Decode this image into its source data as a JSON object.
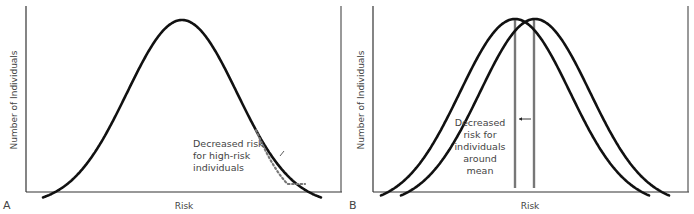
{
  "panels": [
    {
      "id": "A",
      "panel_letter": "A",
      "xlabel": "Risk",
      "ylabel": "Number of Individuals",
      "annotation": [
        "Decreased risk",
        "for high-risk",
        "individuals"
      ],
      "curves": [
        {
          "name": "population distribution",
          "style": "solid",
          "mean": 0.0,
          "sd": 1.0,
          "x_range": [
            -2.6,
            2.6
          ]
        },
        {
          "name": "shifted high-risk tail",
          "style": "dotted",
          "description": "upper tail shifted toward lower risk"
        }
      ]
    },
    {
      "id": "B",
      "panel_letter": "B",
      "xlabel": "Risk",
      "ylabel": "Number of Individuals",
      "annotation": [
        "Decreased",
        "risk for",
        "individuals",
        "around",
        "mean"
      ],
      "curves": [
        {
          "name": "shifted distribution",
          "style": "solid",
          "mean": -0.12,
          "sd": 1.0
        },
        {
          "name": "original distribution",
          "style": "solid",
          "mean": 0.12,
          "sd": 1.0
        }
      ],
      "mean_lines": [
        {
          "name": "new mean",
          "color": "#777777"
        },
        {
          "name": "original mean",
          "color": "#777777"
        }
      ],
      "arrow": {
        "direction": "left"
      }
    }
  ],
  "colors": {
    "curve": "#111111",
    "axis": "#333333",
    "dotted": "#777777",
    "text": "#444444"
  }
}
